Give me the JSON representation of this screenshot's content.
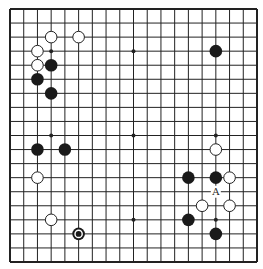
{
  "board": {
    "size": 19,
    "colors": {
      "background": "#ffffff",
      "line": "#222222",
      "black_stone": "#1a1a1a",
      "white_stone_fill": "#ffffff",
      "white_stone_stroke": "#222222"
    },
    "star_points": [
      [
        3,
        3
      ],
      [
        9,
        3
      ],
      [
        15,
        3
      ],
      [
        3,
        9
      ],
      [
        9,
        9
      ],
      [
        15,
        9
      ],
      [
        3,
        15
      ],
      [
        9,
        15
      ],
      [
        15,
        15
      ]
    ],
    "stones": [
      {
        "color": "white",
        "col": 3,
        "row": 2
      },
      {
        "color": "white",
        "col": 5,
        "row": 2
      },
      {
        "color": "white",
        "col": 2,
        "row": 3
      },
      {
        "color": "white",
        "col": 2,
        "row": 4
      },
      {
        "color": "black",
        "col": 3,
        "row": 4
      },
      {
        "color": "black",
        "col": 2,
        "row": 5
      },
      {
        "color": "black",
        "col": 3,
        "row": 6
      },
      {
        "color": "black",
        "col": 15,
        "row": 3
      },
      {
        "color": "black",
        "col": 2,
        "row": 10
      },
      {
        "color": "black",
        "col": 4,
        "row": 10
      },
      {
        "color": "white",
        "col": 2,
        "row": 12
      },
      {
        "color": "white",
        "col": 3,
        "row": 15
      },
      {
        "color": "black",
        "col": 5,
        "row": 16,
        "last_move": true
      },
      {
        "color": "white",
        "col": 15,
        "row": 10
      },
      {
        "color": "black",
        "col": 13,
        "row": 12
      },
      {
        "color": "black",
        "col": 15,
        "row": 12
      },
      {
        "color": "white",
        "col": 16,
        "row": 12
      },
      {
        "color": "white",
        "col": 14,
        "row": 14
      },
      {
        "color": "white",
        "col": 16,
        "row": 14
      },
      {
        "color": "black",
        "col": 13,
        "row": 15
      },
      {
        "color": "black",
        "col": 15,
        "row": 16
      }
    ],
    "labels": [
      {
        "text": "A",
        "col": 15,
        "row": 13
      }
    ]
  }
}
